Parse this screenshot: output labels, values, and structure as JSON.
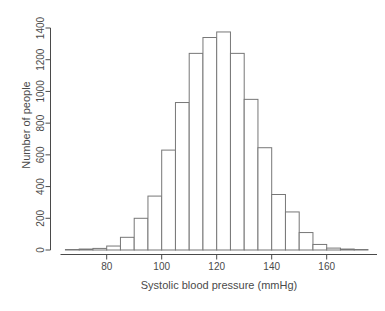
{
  "chart_data": {
    "type": "bar",
    "variant": "histogram",
    "title": "",
    "xlabel": "Systolic blood pressure (mmHg)",
    "ylabel": "Number of people",
    "bin_edges": [
      65,
      70,
      75,
      80,
      85,
      90,
      95,
      100,
      105,
      110,
      115,
      120,
      125,
      130,
      135,
      140,
      145,
      150,
      155,
      160,
      165,
      170,
      175
    ],
    "values": [
      3,
      6,
      10,
      25,
      80,
      200,
      340,
      630,
      930,
      1240,
      1340,
      1375,
      1240,
      950,
      645,
      350,
      240,
      110,
      35,
      12,
      6,
      3
    ],
    "x_ticks": [
      80,
      100,
      120,
      140,
      160
    ],
    "y_ticks": [
      0,
      200,
      400,
      600,
      800,
      1000,
      1200,
      1400
    ],
    "xlim": [
      63,
      178
    ],
    "ylim": [
      0,
      1400
    ],
    "grid": false,
    "legend": "none",
    "bar_fill": "#ffffff",
    "bar_stroke": "#777777",
    "axis_color": "#4a4a4a",
    "text_color": "#4a4a4a",
    "background": "#ffffff"
  }
}
